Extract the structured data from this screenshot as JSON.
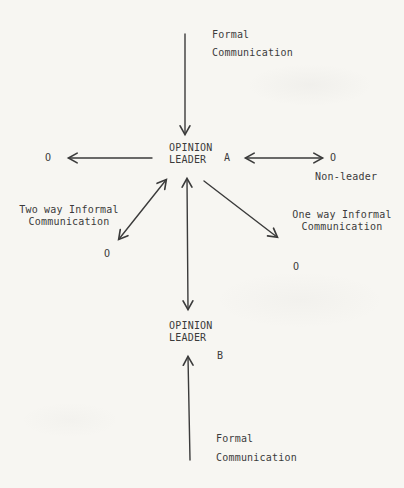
{
  "colors": {
    "paper": "#f7f6f2",
    "ink": "#3b3b3b"
  },
  "labels": {
    "formal_top": {
      "line1": "Formal",
      "line2": "Communication"
    },
    "opinion_leader_a": {
      "line1": "OPINION",
      "line2": "LEADER"
    },
    "node_a": "A",
    "o_left": "O",
    "o_right": "O",
    "non_leader": "Non-leader",
    "two_way": {
      "line1": "Two way Informal",
      "line2": "Communication"
    },
    "one_way": {
      "line1": "One way Informal",
      "line2": "Communication"
    },
    "o_bottom_left": "O",
    "o_bottom_right": "O",
    "opinion_leader_b": {
      "line1": "OPINION",
      "line2": "LEADER"
    },
    "node_b": "B",
    "formal_bottom": {
      "line1": "Formal",
      "line2": "Communication"
    }
  },
  "arrows": [
    {
      "name": "formal-communication-arrow-top",
      "from": [
        185,
        34
      ],
      "to": [
        185,
        134
      ],
      "heads": "end"
    },
    {
      "name": "opinion-leader-a-to-left-o-arrow",
      "from": [
        152,
        158
      ],
      "to": [
        69,
        158
      ],
      "heads": "end"
    },
    {
      "name": "two-way-arrow-a-to-right-o",
      "from": [
        246,
        158
      ],
      "to": [
        322,
        158
      ],
      "heads": "both"
    },
    {
      "name": "two-way-informal-arrow",
      "from": [
        166,
        180
      ],
      "to": [
        119,
        239
      ],
      "heads": "both"
    },
    {
      "name": "opinion-leader-a-b-vertical-arrow",
      "from": [
        187,
        179
      ],
      "to": [
        188,
        309
      ],
      "heads": "both"
    },
    {
      "name": "one-way-informal-arrow",
      "from": [
        204,
        181
      ],
      "to": [
        277,
        237
      ],
      "heads": "end"
    },
    {
      "name": "formal-communication-arrow-bottom",
      "from": [
        190,
        460
      ],
      "to": [
        188,
        357
      ],
      "heads": "end"
    }
  ]
}
